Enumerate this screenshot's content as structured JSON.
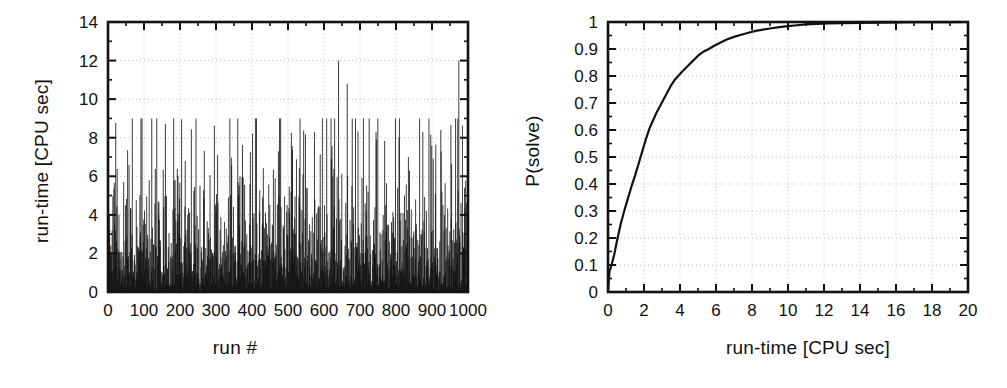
{
  "figure": {
    "background": "#ffffff",
    "ink": "#111111",
    "grid_color": "#bdbdbd"
  },
  "panels": [
    {
      "id": "left",
      "xlabel": "run #",
      "ylabel": "run-time [CPU sec]"
    },
    {
      "id": "right",
      "xlabel": "run-time [CPU sec]",
      "ylabel": "P(solve)"
    }
  ],
  "chart_data": [
    {
      "type": "bar",
      "id": "runtime-per-run",
      "title": "",
      "xlabel": "run #",
      "ylabel": "run-time [CPU sec]",
      "xlim": [
        0,
        1000
      ],
      "ylim": [
        0,
        14
      ],
      "xticks": [
        0,
        100,
        200,
        300,
        400,
        500,
        600,
        700,
        800,
        900,
        1000
      ],
      "xticklabels": [
        "0",
        "100",
        "200",
        "300",
        "400",
        "500",
        "600",
        "700",
        "800",
        "900",
        "1000"
      ],
      "yticks": [
        0,
        2,
        4,
        6,
        8,
        10,
        12,
        14
      ],
      "yticklabels": [
        "0",
        "2",
        "4",
        "6",
        "8",
        "10",
        "12",
        "14"
      ],
      "minor_ticks": true,
      "grid": true,
      "grid_style": "dotted",
      "legend": "none",
      "series_style": "impulses",
      "n_runs": 1000,
      "notes": "Each run plotted as a vertical impulse from 0 to its run-time; heavy-tailed exponential-like spread, median near 2.2 s, max spike 12.0 s near run 640.",
      "summary_stats": {
        "min": 0.02,
        "median": 2.2,
        "mean": 2.85,
        "max": 12.0,
        "max_at_run": 640
      },
      "categories": [
        0,
        1,
        2,
        3,
        4,
        5,
        6,
        7,
        8,
        9,
        10,
        11,
        12,
        13,
        14,
        15,
        16,
        17,
        18,
        19,
        20,
        21,
        22,
        23,
        24,
        25,
        26,
        27,
        28,
        29,
        30,
        31,
        32,
        33,
        34,
        35,
        36,
        37,
        38,
        39,
        40,
        41,
        42,
        43,
        44,
        45,
        46,
        47,
        48,
        49,
        50,
        51,
        52,
        53,
        54,
        55,
        56,
        57,
        58,
        59,
        60,
        61,
        62,
        63,
        64,
        65,
        66,
        67,
        68,
        69,
        70,
        71,
        72,
        73,
        74,
        75,
        76,
        77,
        78,
        79,
        80,
        81,
        82,
        83,
        84,
        85,
        86,
        87,
        88,
        89,
        90,
        91,
        92,
        93,
        94,
        95,
        96,
        97,
        98,
        99
      ],
      "values": [
        4.0,
        1.2,
        0.6,
        2.0,
        3.1,
        0.9,
        1.5,
        2.6,
        0.4,
        3.3,
        1.1,
        5.8,
        0.8,
        2.2,
        1.4,
        4.4,
        0.5,
        1.9,
        3.0,
        0.7,
        2.4,
        6.8,
        1.0,
        0.3,
        2.9,
        1.6,
        3.7,
        0.6,
        1.3,
        2.1,
        7.1,
        0.9,
        1.8,
        4.9,
        2.5,
        0.5,
        3.4,
        1.1,
        2.0,
        5.6,
        0.8,
        1.7,
        2.8,
        0.4,
        3.9,
        1.2,
        5.9,
        2.3,
        0.6,
        1.5,
        4.1,
        2.7,
        0.9,
        3.2,
        1.0,
        2.4,
        0.5,
        4.8,
        1.8,
        3.0,
        0.7,
        2.2,
        6.0,
        1.4,
        0.3,
        2.6,
        10.8,
        1.1,
        3.5,
        0.8,
        2.0,
        4.6,
        1.6,
        0.5,
        8.3,
        2.9,
        1.2,
        3.8,
        0.6,
        2.1,
        5.4,
        1.9,
        0.9,
        7.0,
        2.5,
        0.4,
        3.3,
        1.3,
        4.2,
        2.7,
        0.8,
        1.5,
        8.4,
        2.2,
        0.6,
        3.6,
        1.0,
        12.0,
        2.4,
        0.7
      ]
    },
    {
      "type": "line",
      "id": "p-solve-cdf",
      "title": "",
      "xlabel": "run-time [CPU sec]",
      "ylabel": "P(solve)",
      "xlim": [
        0,
        20
      ],
      "ylim": [
        0,
        1
      ],
      "xticks": [
        0,
        2,
        4,
        6,
        8,
        10,
        12,
        14,
        16,
        18,
        20
      ],
      "xticklabels": [
        "0",
        "2",
        "4",
        "6",
        "8",
        "10",
        "12",
        "14",
        "16",
        "18",
        "20"
      ],
      "yticks": [
        0,
        0.1,
        0.2,
        0.3,
        0.4,
        0.5,
        0.6,
        0.7,
        0.8,
        0.9,
        1
      ],
      "yticklabels": [
        "0",
        "0.1",
        "0.2",
        "0.3",
        "0.4",
        "0.5",
        "0.6",
        "0.7",
        "0.8",
        "0.9",
        "1"
      ],
      "minor_ticks": true,
      "grid": true,
      "grid_style": "dotted",
      "legend": "none",
      "notes": "Empirical cumulative distribution of run-times; rises steeply, ~0.6 by 2.2 s, ~0.8 by 3.6 s, ~0.95 by 6.4 s, saturating at 1 beyond ~11 s.",
      "x": [
        0.0,
        0.08,
        0.2,
        0.35,
        0.5,
        0.7,
        0.9,
        1.1,
        1.3,
        1.5,
        1.7,
        1.9,
        2.1,
        2.3,
        2.5,
        2.7,
        2.9,
        3.1,
        3.3,
        3.5,
        3.7,
        3.9,
        4.1,
        4.4,
        4.7,
        5.0,
        5.3,
        5.6,
        5.9,
        6.2,
        6.6,
        7.0,
        7.4,
        7.8,
        8.2,
        8.6,
        9.0,
        9.5,
        10.0,
        10.5,
        11.0,
        11.6,
        12.2,
        13.0,
        14.0,
        15.0,
        16.0,
        17.0,
        18.0,
        19.0,
        20.0
      ],
      "y": [
        0.0,
        0.075,
        0.1,
        0.14,
        0.19,
        0.25,
        0.3,
        0.345,
        0.39,
        0.43,
        0.475,
        0.52,
        0.565,
        0.605,
        0.635,
        0.665,
        0.69,
        0.715,
        0.74,
        0.765,
        0.785,
        0.8,
        0.815,
        0.835,
        0.855,
        0.875,
        0.89,
        0.9,
        0.912,
        0.922,
        0.935,
        0.945,
        0.953,
        0.96,
        0.967,
        0.972,
        0.976,
        0.981,
        0.985,
        0.988,
        0.991,
        0.993,
        0.995,
        0.996,
        0.997,
        0.998,
        0.9985,
        0.999,
        0.9993,
        0.9996,
        1.0
      ]
    }
  ]
}
